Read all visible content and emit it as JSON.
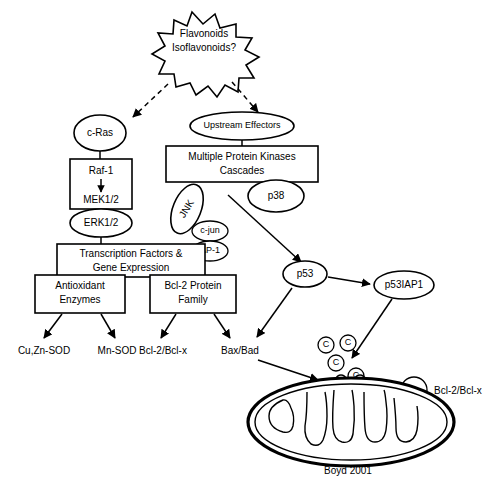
{
  "diagram": {
    "caption": "Boyd 2001",
    "stimulus": {
      "line1": "Flavonoids",
      "line2": "Isoflavonoids?"
    },
    "left_cascade": {
      "c_ras": "c-Ras",
      "raf1": "Raf-1",
      "mek": "MEK1/2",
      "erk": "ERK1/2"
    },
    "right_cascade": {
      "upstream": "Upstream Effectors",
      "kinases_line1": "Multiple Protein Kinases",
      "kinases_line2": "Cascades",
      "jnk": "JNK",
      "p38": "p38",
      "c_jun": "c-jun",
      "ap1": "AP-1"
    },
    "transcription": {
      "line1": "Transcription Factors &",
      "line2": "Gene Expression"
    },
    "effector_boxes": {
      "antioxidant_line1": "Antioxidant",
      "antioxidant_line2": "Enzymes",
      "bcl2_line1": "Bcl-2 Protein",
      "bcl2_line2": "Family"
    },
    "terminals": {
      "cuznsod": "Cu,Zn-SOD",
      "mnsod": "Mn-SOD",
      "bcl2_bclx": "Bcl-2/Bcl-x",
      "bax_bad": "Bax/Bad"
    },
    "p53_branch": {
      "p53": "p53",
      "p53iap1": "p53IAP1"
    },
    "mitochondria": {
      "cytochrome_c_label": "C",
      "cytochrome_c_count": 4,
      "bcl2_membrane_label": "Bcl-2/Bcl-x"
    },
    "colors": {
      "stroke": "#000000",
      "fill": "#ffffff",
      "background": "#ffffff"
    }
  }
}
